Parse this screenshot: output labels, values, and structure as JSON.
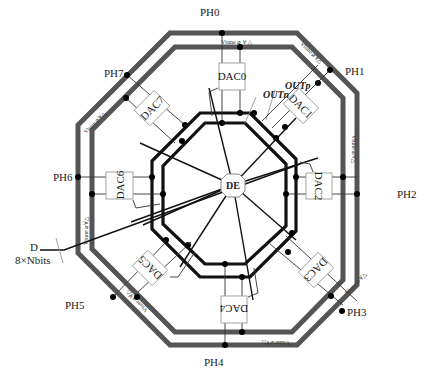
{
  "diagram": {
    "colors": {
      "vtune_ring": "#555555",
      "signal_ring": "#111111",
      "thin_wire": "#333333",
      "dac_box_stroke": "#999999",
      "dac_box_fill": "#ffffff",
      "node": "#000000"
    },
    "center_block": {
      "label": "DE",
      "x": 233,
      "y": 185
    },
    "outputs": {
      "outp": "OUTp",
      "outn": "OUTn"
    },
    "input": {
      "name": "D",
      "width_label": "8×Nbits"
    },
    "vtune_label": "Vtune",
    "phases": [
      {
        "id": "PH0",
        "label": "PH0",
        "lx": 211,
        "ly": 14
      },
      {
        "id": "PH1",
        "label": "PH1",
        "lx": 355,
        "ly": 74
      },
      {
        "id": "PH2",
        "label": "PH2",
        "lx": 395,
        "ly": 196
      },
      {
        "id": "PH3",
        "label": "PH3",
        "lx": 355,
        "ly": 317
      },
      {
        "id": "PH4",
        "label": "PH4",
        "lx": 211,
        "ly": 377
      },
      {
        "id": "PH5",
        "label": "PH5",
        "lx": 72,
        "ly": 311
      },
      {
        "id": "PH6",
        "label": "PH6",
        "lx": 60,
        "ly": 183
      },
      {
        "id": "PH7",
        "label": "PH7",
        "lx": 97,
        "ly": 78
      }
    ],
    "dacs": [
      {
        "label": "DAC0",
        "x": 231,
        "y": 76,
        "rot": 0
      },
      {
        "label": "DAC1",
        "x": 315,
        "y": 111,
        "rot": 45
      },
      {
        "label": "DAC2",
        "x": 350,
        "y": 194,
        "rot": 90
      },
      {
        "label": "DAC3",
        "x": 317,
        "y": 277,
        "rot": 135
      },
      {
        "label": "DAC4",
        "x": 233,
        "y": 311,
        "rot": 180
      },
      {
        "label": "DAC5",
        "x": 151,
        "y": 276,
        "rot": 225
      },
      {
        "label": "DAC6",
        "x": 116,
        "y": 194,
        "rot": 270
      },
      {
        "label": "DAC7",
        "x": 151,
        "y": 110,
        "rot": 315
      }
    ]
  }
}
